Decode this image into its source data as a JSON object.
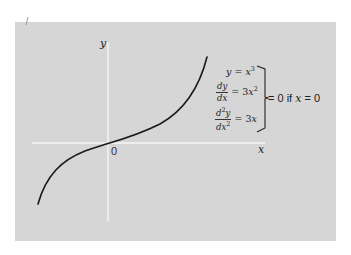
{
  "figure": {
    "axes": {
      "x_label": "x",
      "y_label": "y",
      "origin_label": "0"
    },
    "curve": {
      "function": "y = x^3",
      "description": "cubic curve with inflection point at origin"
    },
    "equations": {
      "eq1_lhs": "y",
      "eq1_eq": " = ",
      "eq1_rhs_base": "x",
      "eq1_rhs_exp": "3",
      "eq2_num": "dy",
      "eq2_den": "dx",
      "eq2_eq": " = 3",
      "eq2_rhs_base": "x",
      "eq2_rhs_exp": "2",
      "eq3_num_base": "d",
      "eq3_num_exp": "2",
      "eq3_num_var": "y",
      "eq3_den_base": "dx",
      "eq3_den_exp": "2",
      "eq3_eq": " = 3",
      "eq3_rhs": "x"
    },
    "condition": {
      "prefix": "= 0 if ",
      "var": "x",
      "suffix": " = 0"
    }
  },
  "colors": {
    "panel_background": "#d6d6d6",
    "axis": "#f4f4f4",
    "curve": "#1a1a1a",
    "text": "#222222"
  }
}
